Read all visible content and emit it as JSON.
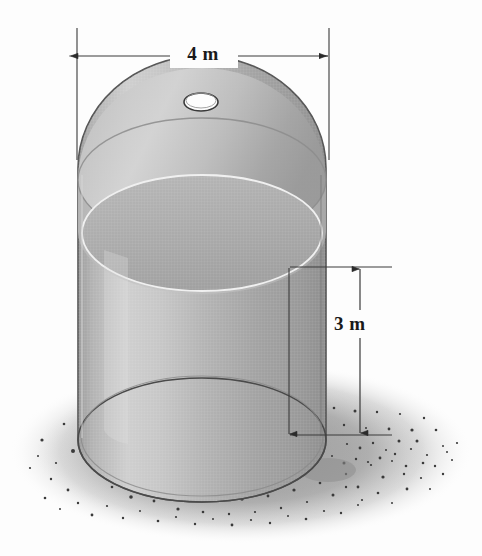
{
  "figure": {
    "kind": "technical-illustration",
    "background_color": "#fdfdfd"
  },
  "dimensions": {
    "width_label": "4 m",
    "height_label": "3 m",
    "width_value": 4,
    "height_value": 3,
    "units": "m"
  },
  "object": {
    "name": "cylindrical-tank",
    "shape": "cylinder with domed top",
    "has_opening": true,
    "opening_name": "circular hatch",
    "contents": "liquid",
    "body_color": "#b0b0b0",
    "outline_color": "#4a4a4a",
    "liquid_color": "#a8a8a8",
    "highlight_color": "#d8d8d8"
  },
  "ground": {
    "name": "gravel-ground",
    "base_color": "#aeaeae",
    "speckle_color": "#3c3c3c",
    "shadow_color": "#9a9a9a"
  },
  "annotations": {
    "line_color": "#3a3a3a",
    "arrow_color": "#2b2b2b"
  }
}
